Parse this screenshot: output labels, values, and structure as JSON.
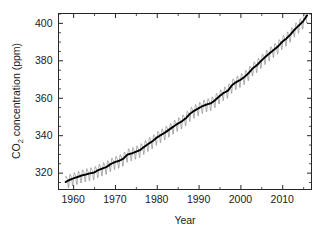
{
  "chart_data": {
    "type": "line",
    "title": "",
    "subtitle": "",
    "xlabel": "Year",
    "ylabel": "CO2 concentration (ppm)",
    "ylabel_parts": {
      "lead": "CO",
      "sub": "2",
      "trail": " concentration (ppm)"
    },
    "xlim": [
      1956.5,
      2017.0
    ],
    "ylim": [
      311.0,
      405.0
    ],
    "xticks": [
      1960,
      1970,
      1980,
      1990,
      2000,
      2010
    ],
    "xtick_labels": [
      "1960",
      "1970",
      "1980",
      "1990",
      "2000",
      "2010"
    ],
    "xminor_interval": 5,
    "yticks": [
      320,
      340,
      360,
      380,
      400
    ],
    "ytick_labels": [
      "320",
      "340",
      "360",
      "380",
      "400"
    ],
    "yminor_interval": 5,
    "grid": false,
    "legend": null,
    "legend_position": "none",
    "frame": "box",
    "tick_direction": "in",
    "annotations": [],
    "series": [
      {
        "name": "Monthly mean CO2 (seasonal cycle)",
        "color": "#6e6e6e",
        "linewidth": 0.55,
        "description": "Monthly Mauna Loa record showing annual sawtooth oscillation of roughly 6 ppm peak-to-trough superposed on the rising trend",
        "seasonal_amplitude_ppm": 3.2,
        "x": [
          1958.2,
          1959,
          1960,
          1961,
          1962,
          1963,
          1964,
          1965,
          1966,
          1967,
          1968,
          1969,
          1970,
          1971,
          1972,
          1973,
          1974,
          1975,
          1976,
          1977,
          1978,
          1979,
          1980,
          1981,
          1982,
          1983,
          1984,
          1985,
          1986,
          1987,
          1988,
          1989,
          1990,
          1991,
          1992,
          1993,
          1994,
          1995,
          1996,
          1997,
          1998,
          1999,
          2000,
          2001,
          2002,
          2003,
          2004,
          2005,
          2006,
          2007,
          2008,
          2009,
          2010,
          2011,
          2012,
          2013,
          2014,
          2015,
          2016
        ],
        "values": [
          315.0,
          315.98,
          316.91,
          317.64,
          318.45,
          318.99,
          319.62,
          320.04,
          321.37,
          322.18,
          323.05,
          324.62,
          325.68,
          326.32,
          327.46,
          329.68,
          330.25,
          331.15,
          332.04,
          333.83,
          335.4,
          336.84,
          338.75,
          340.11,
          341.45,
          343.05,
          344.65,
          346.12,
          347.42,
          349.19,
          351.57,
          353.12,
          354.39,
          355.61,
          356.45,
          357.1,
          358.83,
          360.82,
          362.61,
          363.73,
          366.7,
          368.38,
          369.55,
          371.14,
          373.28,
          375.8,
          377.52,
          379.8,
          381.9,
          383.79,
          385.6,
          387.43,
          389.9,
          391.65,
          393.85,
          396.52,
          398.65,
          400.83,
          404.2
        ]
      },
      {
        "name": "Seasonally adjusted trend",
        "color": "#000000",
        "linewidth": 1.9,
        "description": "Bold smoothed trend line through the deseasonalized monthly means",
        "x": [
          1958.2,
          1959,
          1960,
          1961,
          1962,
          1963,
          1964,
          1965,
          1966,
          1967,
          1968,
          1969,
          1970,
          1971,
          1972,
          1973,
          1974,
          1975,
          1976,
          1977,
          1978,
          1979,
          1980,
          1981,
          1982,
          1983,
          1984,
          1985,
          1986,
          1987,
          1988,
          1989,
          1990,
          1991,
          1992,
          1993,
          1994,
          1995,
          1996,
          1997,
          1998,
          1999,
          2000,
          2001,
          2002,
          2003,
          2004,
          2005,
          2006,
          2007,
          2008,
          2009,
          2010,
          2011,
          2012,
          2013,
          2014,
          2015,
          2016
        ],
        "values": [
          315.0,
          315.98,
          316.91,
          317.64,
          318.45,
          318.99,
          319.62,
          320.04,
          321.37,
          322.18,
          323.05,
          324.62,
          325.68,
          326.32,
          327.46,
          329.68,
          330.25,
          331.15,
          332.04,
          333.83,
          335.4,
          336.84,
          338.75,
          340.11,
          341.45,
          343.05,
          344.65,
          346.12,
          347.42,
          349.19,
          351.57,
          353.12,
          354.39,
          355.61,
          356.45,
          357.1,
          358.83,
          360.82,
          362.61,
          363.73,
          366.7,
          368.38,
          369.55,
          371.14,
          373.28,
          375.8,
          377.52,
          379.8,
          381.9,
          383.79,
          385.6,
          387.43,
          389.9,
          391.65,
          393.85,
          396.52,
          398.65,
          400.83,
          404.2
        ]
      }
    ],
    "colors": {
      "axis": "#262626",
      "trend": "#000000",
      "seasonal": "#6e6e6e",
      "background": "#ffffff",
      "text": "#1a1a1a"
    }
  }
}
